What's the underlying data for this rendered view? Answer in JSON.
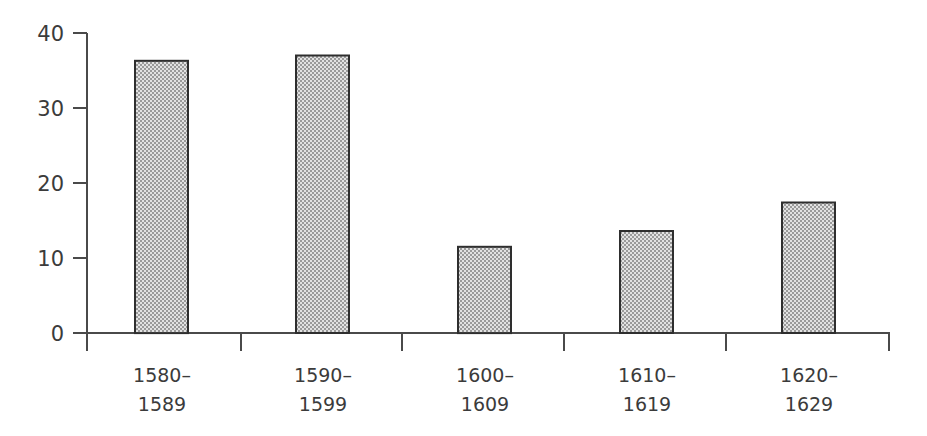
{
  "chart_data": {
    "type": "bar",
    "title": "",
    "subtitle": "",
    "xlabel": "",
    "ylabel": "",
    "categories": [
      "1580–1589",
      "1590–1599",
      "1600–1609",
      "1610–1619",
      "1620–1629"
    ],
    "category_lines": [
      [
        "1580–",
        "1589"
      ],
      [
        "1590–",
        "1599"
      ],
      [
        "1600–",
        "1609"
      ],
      [
        "1610–",
        "1619"
      ],
      [
        "1620–",
        "1629"
      ]
    ],
    "values": [
      36.3,
      37.0,
      11.5,
      13.6,
      17.4
    ],
    "ylim": [
      0,
      40
    ],
    "yticks": [
      0,
      10,
      20,
      30,
      40
    ],
    "ytick_labels": [
      "0",
      "10",
      "20",
      "30",
      "40"
    ],
    "grid": false,
    "legend": null,
    "legend_position": "none",
    "bar_fill_color": "#b9b9b9",
    "bar_edge_color": "#2e2e2e",
    "axis_color": "#4a4a4a",
    "text_color": "#3b3b3b",
    "background_color": "#ffffff"
  },
  "axes": {
    "y_axis_name": "y-axis",
    "x_axis_name": "x-axis"
  }
}
